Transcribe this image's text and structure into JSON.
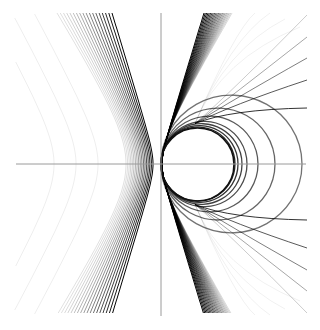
{
  "figure": {
    "width": 320,
    "height": 330,
    "background": "#ffffff",
    "stroke_color": "#000000",
    "axes": {
      "color": "#9a9a9a",
      "origin": [
        161,
        164
      ],
      "x_axis": {
        "from": 16,
        "to": 306
      },
      "y_axis": {
        "from": 13,
        "to": 316
      }
    },
    "circle": {
      "cx": 197.5,
      "cy": 164.5,
      "r": 36.5
    },
    "left_family": {
      "count": 18,
      "vertex_x_min": 126,
      "vertex_x_max": 153,
      "top_x_min": 57,
      "top_x_max": 112
    },
    "right_family": {
      "count": 22,
      "apex_x": 162,
      "top_x_min": 204,
      "top_x_max": 232
    },
    "closed_loops_axis_crossings": [
      235,
      238,
      242,
      247,
      258,
      275,
      302
    ],
    "fan_end_y_upper": [
      15,
      37,
      58,
      80,
      108
    ],
    "faint_curve_vertex_x": 54
  }
}
